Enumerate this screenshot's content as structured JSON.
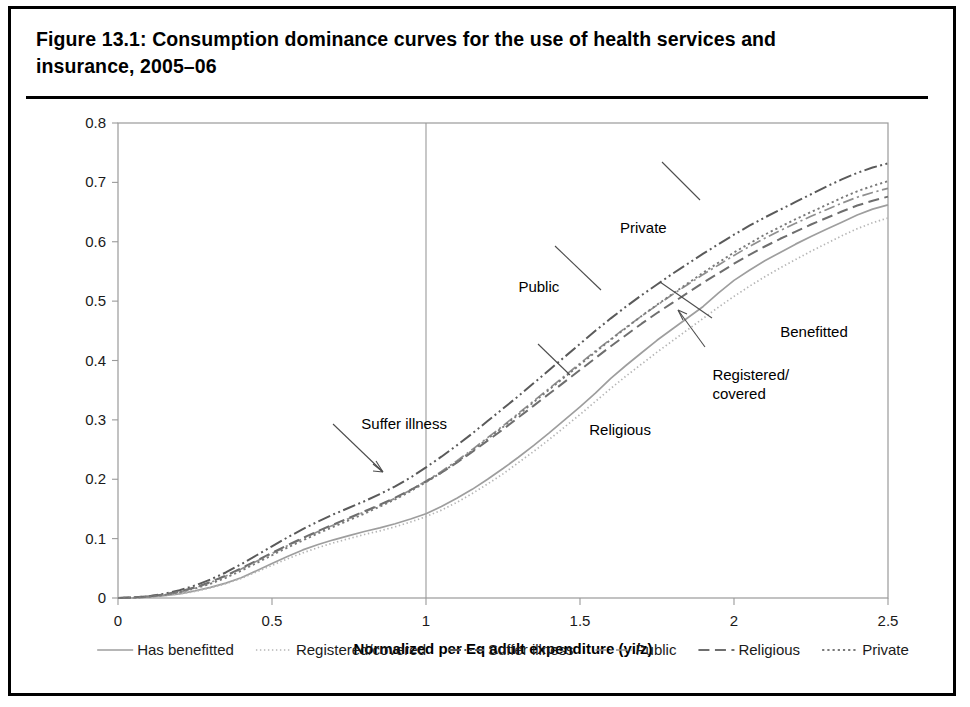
{
  "figure": {
    "title": "Figure 13.1:  Consumption dominance curves for the use of health services and insurance, 2005–06"
  },
  "chart_data": {
    "type": "line",
    "title": "Figure 13.1:  Consumption dominance curves for the use of health services and insurance, 2005–06",
    "xlabel": "Normalized per Eq adult expenditure (yi/z)",
    "ylabel": "",
    "xlim": [
      0,
      2.5
    ],
    "ylim": [
      0,
      0.8
    ],
    "xticks": [
      "0",
      "0.5",
      "1",
      "1.5",
      "2",
      "2.5"
    ],
    "xtick_values": [
      0,
      0.5,
      1,
      1.5,
      2,
      2.5
    ],
    "yticks": [
      "0",
      "0.1",
      "0.2",
      "0.3",
      "0.4",
      "0.5",
      "0.6",
      "0.7",
      "0.8"
    ],
    "ytick_values": [
      0,
      0.1,
      0.2,
      0.3,
      0.4,
      0.5,
      0.6,
      0.7,
      0.8
    ],
    "grid": "vertical-at-x-1",
    "legend_position": "bottom",
    "reference_line_x": 1,
    "x": [
      0,
      0.05,
      0.1,
      0.15,
      0.2,
      0.25,
      0.3,
      0.35,
      0.4,
      0.45,
      0.5,
      0.55,
      0.6,
      0.65,
      0.7,
      0.75,
      0.8,
      0.85,
      0.9,
      0.95,
      1.0,
      1.05,
      1.1,
      1.15,
      1.2,
      1.25,
      1.3,
      1.35,
      1.4,
      1.45,
      1.5,
      1.55,
      1.6,
      1.65,
      1.7,
      1.75,
      1.8,
      1.85,
      1.9,
      1.95,
      2.0,
      2.05,
      2.1,
      2.15,
      2.2,
      2.25,
      2.3,
      2.35,
      2.4,
      2.45,
      2.5
    ],
    "series": [
      {
        "name": "Has benefitted",
        "style": "solid",
        "color": "#9e9e9e",
        "width": 1.7,
        "values": [
          0,
          0,
          0.002,
          0.004,
          0.007,
          0.012,
          0.018,
          0.025,
          0.034,
          0.046,
          0.058,
          0.07,
          0.081,
          0.09,
          0.098,
          0.105,
          0.112,
          0.118,
          0.125,
          0.133,
          0.142,
          0.154,
          0.168,
          0.183,
          0.2,
          0.218,
          0.237,
          0.257,
          0.278,
          0.3,
          0.322,
          0.345,
          0.37,
          0.392,
          0.413,
          0.434,
          0.453,
          0.472,
          0.491,
          0.514,
          0.535,
          0.552,
          0.568,
          0.582,
          0.596,
          0.609,
          0.621,
          0.633,
          0.645,
          0.655,
          0.662
        ]
      },
      {
        "name": "Registered/covered",
        "style": "dotted-fine",
        "color": "#b5b5b5",
        "width": 1.7,
        "values": [
          0,
          0,
          0.002,
          0.004,
          0.007,
          0.011,
          0.017,
          0.024,
          0.033,
          0.044,
          0.055,
          0.066,
          0.076,
          0.085,
          0.093,
          0.1,
          0.107,
          0.113,
          0.12,
          0.128,
          0.137,
          0.148,
          0.161,
          0.176,
          0.192,
          0.209,
          0.228,
          0.247,
          0.267,
          0.288,
          0.309,
          0.331,
          0.353,
          0.374,
          0.394,
          0.414,
          0.433,
          0.452,
          0.471,
          0.49,
          0.508,
          0.525,
          0.541,
          0.556,
          0.57,
          0.584,
          0.597,
          0.61,
          0.622,
          0.632,
          0.64
        ]
      },
      {
        "name": "Suffer illness",
        "style": "dash-dot-dot",
        "color": "#5a5a5a",
        "width": 2.0,
        "values": [
          0,
          0.001,
          0.003,
          0.007,
          0.013,
          0.021,
          0.031,
          0.043,
          0.057,
          0.072,
          0.087,
          0.102,
          0.116,
          0.129,
          0.141,
          0.152,
          0.163,
          0.175,
          0.188,
          0.203,
          0.22,
          0.238,
          0.257,
          0.277,
          0.298,
          0.319,
          0.34,
          0.362,
          0.384,
          0.406,
          0.428,
          0.45,
          0.471,
          0.491,
          0.51,
          0.528,
          0.546,
          0.563,
          0.58,
          0.596,
          0.612,
          0.627,
          0.641,
          0.654,
          0.667,
          0.68,
          0.693,
          0.705,
          0.716,
          0.725,
          0.732
        ]
      },
      {
        "name": "Public",
        "style": "dash-dot",
        "color": "#8f8f8f",
        "width": 1.7,
        "values": [
          0,
          0,
          0.002,
          0.005,
          0.01,
          0.017,
          0.026,
          0.037,
          0.049,
          0.062,
          0.075,
          0.088,
          0.1,
          0.112,
          0.123,
          0.134,
          0.145,
          0.156,
          0.168,
          0.182,
          0.197,
          0.213,
          0.231,
          0.25,
          0.27,
          0.29,
          0.311,
          0.332,
          0.353,
          0.374,
          0.395,
          0.416,
          0.436,
          0.456,
          0.475,
          0.493,
          0.511,
          0.528,
          0.545,
          0.561,
          0.577,
          0.592,
          0.606,
          0.619,
          0.631,
          0.643,
          0.654,
          0.665,
          0.675,
          0.683,
          0.69
        ]
      },
      {
        "name": "Religious",
        "style": "dashed",
        "color": "#6e6e6e",
        "width": 2.0,
        "values": [
          0,
          0.001,
          0.003,
          0.006,
          0.011,
          0.018,
          0.027,
          0.038,
          0.05,
          0.063,
          0.076,
          0.089,
          0.101,
          0.113,
          0.124,
          0.135,
          0.146,
          0.157,
          0.169,
          0.182,
          0.196,
          0.211,
          0.228,
          0.246,
          0.265,
          0.284,
          0.304,
          0.324,
          0.344,
          0.364,
          0.384,
          0.404,
          0.424,
          0.443,
          0.462,
          0.48,
          0.497,
          0.514,
          0.531,
          0.547,
          0.563,
          0.578,
          0.592,
          0.605,
          0.617,
          0.629,
          0.64,
          0.651,
          0.661,
          0.669,
          0.676
        ]
      },
      {
        "name": "Private",
        "style": "dotted",
        "color": "#7a7a7a",
        "width": 1.9,
        "values": [
          0,
          0.001,
          0.002,
          0.005,
          0.01,
          0.016,
          0.024,
          0.034,
          0.046,
          0.059,
          0.072,
          0.085,
          0.097,
          0.109,
          0.12,
          0.131,
          0.142,
          0.154,
          0.166,
          0.18,
          0.195,
          0.211,
          0.229,
          0.248,
          0.268,
          0.288,
          0.309,
          0.33,
          0.351,
          0.372,
          0.393,
          0.414,
          0.435,
          0.455,
          0.475,
          0.494,
          0.512,
          0.53,
          0.548,
          0.565,
          0.582,
          0.597,
          0.612,
          0.625,
          0.638,
          0.65,
          0.662,
          0.674,
          0.685,
          0.694,
          0.702
        ]
      }
    ],
    "annotations": [
      {
        "text": "Private",
        "x": 1.63,
        "y": 0.615
      },
      {
        "text": "Public",
        "x": 1.3,
        "y": 0.515
      },
      {
        "text": "Benefitted",
        "x": 2.15,
        "y": 0.44
      },
      {
        "text": "Registered/",
        "x": 1.93,
        "y": 0.368
      },
      {
        "text": "covered",
        "x": 1.93,
        "y": 0.335
      },
      {
        "text": "Suffer illness",
        "x": 0.79,
        "y": 0.285
      },
      {
        "text": "Religious",
        "x": 1.53,
        "y": 0.275
      }
    ]
  },
  "legend": {
    "items": [
      {
        "label": "Has benefitted",
        "style": "solid"
      },
      {
        "label": "Registered/covered",
        "style": "dotted-fine"
      },
      {
        "label": "Suffer illness",
        "style": "dash-dot-dot"
      },
      {
        "label": "Public",
        "style": "dash-dot"
      },
      {
        "label": "Religious",
        "style": "dashed"
      },
      {
        "label": "Private",
        "style": "dotted"
      }
    ]
  }
}
